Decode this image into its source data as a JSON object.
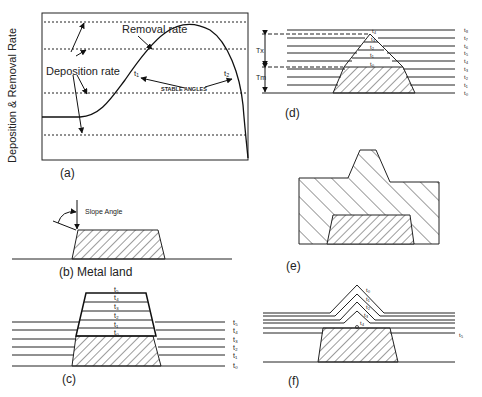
{
  "figure": {
    "panels": [
      {
        "id": "a",
        "caption": "(a)"
      },
      {
        "id": "b",
        "caption": "(b) Metal land"
      },
      {
        "id": "c",
        "caption": "(c)"
      },
      {
        "id": "d",
        "caption": "(d)"
      },
      {
        "id": "e",
        "caption": "(e)"
      },
      {
        "id": "f",
        "caption": "(f)"
      }
    ]
  },
  "panel_a": {
    "ylabel": "Deposition & Removal Rate",
    "removal_label": "Removal rate",
    "deposition_label": "Deposition rate",
    "stable_label": "STABLE ANGLES",
    "t1": "t₁",
    "t2": "t₂"
  },
  "panel_b": {
    "slope_label": "Slope Angle"
  },
  "panel_c": {
    "stack_labels": [
      "t₀",
      "t₁",
      "t₂",
      "t₃",
      "t₄",
      "t₅"
    ],
    "side_labels": [
      "t₅",
      "t₄",
      "t₃",
      "t₂",
      "t₁",
      "t₀"
    ]
  },
  "panel_d": {
    "tx": "Tx",
    "tm": "Tm",
    "stack_labels": [
      "t₀",
      "t₁",
      "t₂",
      "t₃",
      "t₄"
    ],
    "side_labels": [
      "t₈",
      "t₇",
      "t₆",
      "t₅",
      "t₄",
      "t₃",
      "t₂",
      "t₁",
      "t₀"
    ]
  },
  "panel_f": {
    "stack_labels": [
      "t₀",
      "t₁",
      "t₂",
      "t₃",
      "t₄"
    ],
    "side_label": "t₅"
  }
}
